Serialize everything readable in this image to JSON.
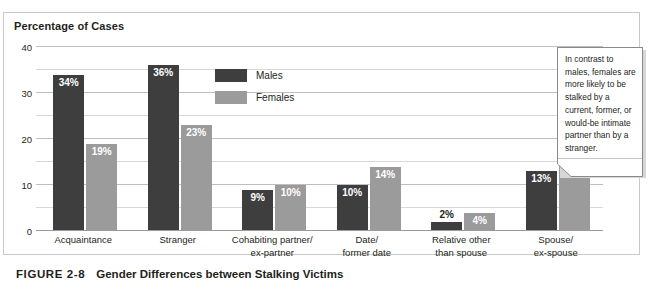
{
  "figure": {
    "number": "FIGURE 2-8",
    "caption": "Gender Differences between Stalking Victims"
  },
  "callout": {
    "text": "In contrast to males, females are more likely to be stalked by a current, former, or would-be intimate partner than by a stranger."
  },
  "colors": {
    "males": "#3e3e3e",
    "females": "#9b9b9b",
    "gridline": "#bfbfbf",
    "text": "#231f20"
  },
  "chart_data": {
    "type": "bar",
    "title": "Percentage of Cases",
    "xlabel": "",
    "ylabel": "Percentage of Cases",
    "ylim": [
      0,
      40
    ],
    "yticks": [
      0,
      10,
      20,
      30,
      40
    ],
    "ytick_labels": [
      "0",
      "10",
      "20",
      "30",
      "40"
    ],
    "minor_tick_step": 5,
    "grid": true,
    "legend_position": "inside-upper-center",
    "categories": [
      "Acquaintance",
      "Stranger",
      "Cohabiting partner/ ex-partner",
      "Date/ former date",
      "Relative other than spouse",
      "Spouse/ ex-spouse"
    ],
    "category_lines": [
      [
        "Acquaintance"
      ],
      [
        "Stranger"
      ],
      [
        "Cohabiting partner/",
        "ex-partner"
      ],
      [
        "Date/",
        "former date"
      ],
      [
        "Relative other",
        "than spouse"
      ],
      [
        "Spouse/",
        "ex-spouse"
      ]
    ],
    "series": [
      {
        "name": "Males",
        "values": [
          34,
          36,
          9,
          10,
          2,
          13
        ],
        "labels": [
          "34%",
          "36%",
          "9%",
          "10%",
          "2%",
          "13%"
        ]
      },
      {
        "name": "Females",
        "values": [
          19,
          23,
          10,
          14,
          4,
          38
        ],
        "labels": [
          "19%",
          "23%",
          "10%",
          "14%",
          "4%",
          "38%"
        ]
      }
    ]
  }
}
